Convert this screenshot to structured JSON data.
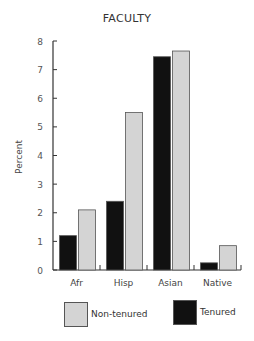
{
  "chart_data": {
    "type": "bar",
    "title": "FACULTY",
    "xlabel": "",
    "ylabel": "Percent",
    "ylim": [
      0,
      8
    ],
    "yticks": [
      0,
      1,
      2,
      3,
      4,
      5,
      6,
      7,
      8
    ],
    "grid": false,
    "legend_position": "bottom",
    "categories": [
      "Afr",
      "Hisp",
      "Asian",
      "Native"
    ],
    "series": [
      {
        "name": "Tenured",
        "color": "#111111",
        "values": [
          1.2,
          2.4,
          7.45,
          0.25
        ]
      },
      {
        "name": "Non-tenured",
        "color": "#d4d4d4",
        "values": [
          2.1,
          5.5,
          7.65,
          0.85
        ]
      }
    ]
  },
  "legend": {
    "items": [
      {
        "label": "Non-tenured",
        "color": "#d4d4d4"
      },
      {
        "label": "Tenured",
        "color": "#111111"
      }
    ]
  }
}
